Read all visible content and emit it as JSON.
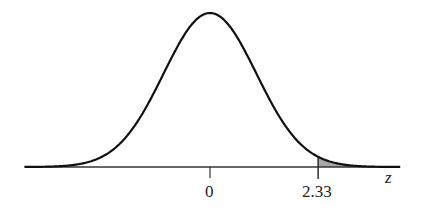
{
  "chart_data": {
    "type": "area",
    "title": "",
    "xlabel": "z",
    "ylabel": "",
    "xlim": [
      -4,
      4.1
    ],
    "x_ticks": [
      {
        "value": 0,
        "label": "0"
      },
      {
        "value": 2.33,
        "label": "2.33"
      }
    ],
    "series": [
      {
        "name": "Standard normal density",
        "mean": 0,
        "sd": 1
      }
    ],
    "shaded_region": {
      "from": 2.33,
      "to": 4.1,
      "side": "right tail",
      "fill": "#a8a8a8"
    },
    "grid": false,
    "legend": null
  },
  "labels": {
    "zero": "0",
    "cut": "2.33",
    "axis": "z"
  },
  "colors": {
    "curve": "#111111",
    "axis": "#333333",
    "shade": "#a8a8a8"
  }
}
